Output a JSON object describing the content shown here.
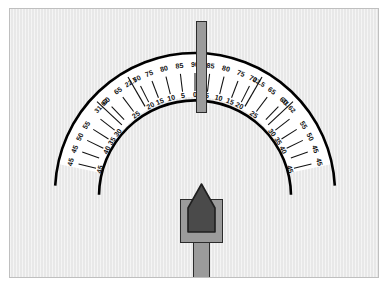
{
  "figure": {
    "kind": "protractor-angle-scale",
    "background_color": "#e8e8e8",
    "band_color": "#ffffff",
    "ink_color": "#111111",
    "pointer_color": "#4a4a4a",
    "metal_color": "#9b9b9b"
  },
  "chart_data": {
    "type": "scatter",
    "title": "",
    "xlabel": "",
    "ylabel": "",
    "grid": false,
    "legend": null,
    "center": {
      "x": 194,
      "y": 192
    },
    "band": {
      "inner_radius": 96,
      "outer_radius": 140
    },
    "angle_range_deg": [
      -78,
      78
    ],
    "inner_row_labels": [
      "45",
      "50",
      "55",
      "31.62",
      "60",
      "65",
      "22.5",
      "70",
      "75",
      "80",
      "85",
      "90",
      "85",
      "80",
      "75",
      "70",
      "22.5",
      "65",
      "60",
      "31.62",
      "55",
      "50",
      "45"
    ],
    "outer_row_labels": [
      "45",
      "40",
      "35",
      "30",
      "25",
      "20",
      "15",
      "10",
      "5",
      "0",
      "5",
      "10",
      "15",
      "20",
      "25",
      "30",
      "35",
      "40",
      "45"
    ],
    "ticks_left": [
      {
        "inner_label": "45",
        "outer_label": "45",
        "angle": -76,
        "long": false
      },
      {
        "inner_label": "45",
        "outer_label": "",
        "angle": -70,
        "long": false
      },
      {
        "inner_label": "50",
        "outer_label": "40",
        "angle": -64,
        "long": false
      },
      {
        "inner_label": "55",
        "outer_label": "35",
        "angle": -58,
        "long": false
      },
      {
        "inner_label": "",
        "outer_label": "30",
        "angle": -52,
        "long": false
      },
      {
        "inner_label": "31.62",
        "outer_label": "",
        "angle": -47,
        "long": true
      },
      {
        "inner_label": "60",
        "outer_label": "",
        "angle": -44,
        "long": false
      },
      {
        "inner_label": "65",
        "outer_label": "25",
        "angle": -37,
        "long": false
      },
      {
        "inner_label": "22.5",
        "outer_label": "",
        "angle": -30,
        "long": true
      },
      {
        "inner_label": "70",
        "outer_label": "20",
        "angle": -27,
        "long": false
      },
      {
        "inner_label": "75",
        "outer_label": "15",
        "angle": -21,
        "long": false
      },
      {
        "inner_label": "80",
        "outer_label": "10",
        "angle": -14,
        "long": false
      },
      {
        "inner_label": "85",
        "outer_label": "5",
        "angle": -7,
        "long": false
      }
    ],
    "ticks_center": [
      {
        "inner_label": "90",
        "outer_label": "0",
        "angle": 0,
        "long": false
      }
    ],
    "ticks_right": [
      {
        "inner_label": "85",
        "outer_label": "5",
        "angle": 7,
        "long": false
      },
      {
        "inner_label": "80",
        "outer_label": "10",
        "angle": 14,
        "long": false
      },
      {
        "inner_label": "75",
        "outer_label": "15",
        "angle": 21,
        "long": false
      },
      {
        "inner_label": "70",
        "outer_label": "20",
        "angle": 27,
        "long": false
      },
      {
        "inner_label": "22.5",
        "outer_label": "",
        "angle": 30,
        "long": true
      },
      {
        "inner_label": "65",
        "outer_label": "25",
        "angle": 37,
        "long": false
      },
      {
        "inner_label": "60",
        "outer_label": "",
        "angle": 44,
        "long": false
      },
      {
        "inner_label": "31.62",
        "outer_label": "",
        "angle": 47,
        "long": true
      },
      {
        "inner_label": "",
        "outer_label": "30",
        "angle": 52,
        "long": false
      },
      {
        "inner_label": "55",
        "outer_label": "35",
        "angle": 58,
        "long": false
      },
      {
        "inner_label": "50",
        "outer_label": "40",
        "angle": 64,
        "long": false
      },
      {
        "inner_label": "45",
        "outer_label": "",
        "angle": 70,
        "long": false
      },
      {
        "inner_label": "45",
        "outer_label": "45",
        "angle": 76,
        "long": false
      }
    ]
  },
  "parts": {
    "needle_label": "vertical-needle",
    "pointer_label": "index-pointer",
    "shaft_label": "pointer-shaft",
    "scale_label": "protractor-scale-band"
  }
}
